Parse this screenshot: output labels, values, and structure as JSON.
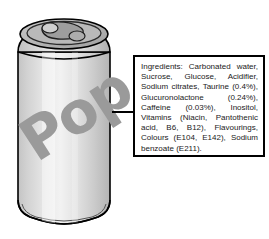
{
  "scene": {
    "background_color": "#ffffff",
    "width": 269,
    "height": 239
  },
  "can": {
    "name": "soda-can",
    "brand_label": "Pop",
    "body_color": "#d6d6d6",
    "highlight_color": "#f1f1f1",
    "logo_color": "#9a9a9a",
    "top_color": "#b8b8b8",
    "outline_color": "#000000",
    "parts": {
      "lid": "can-lid",
      "pull_tab": "pull-tab",
      "shoulder": "can-shoulder",
      "body": "can-body",
      "base": "can-base"
    }
  },
  "leader_line": {
    "name": "callout-leader-line",
    "color": "#000000"
  },
  "callout": {
    "name": "ingredients-callout",
    "border_color": "#000000",
    "background_color": "#ffffff",
    "text_color": "#1a1a1a",
    "heading": "Ingredients:",
    "ingredients_text": "Ingredients: Carbonated water, Sucrose, Glucose, Acidifier, Sodium citrates, Taurine (0.4%), Glucuronolactone (0.24%), Caffeine (0.03%), Inositol, Vitamins (Niacin, Pantothenic acid, B6, B12), Flavourings, Colours (E104, E142), Sodium benzoate (E211).",
    "ingredient_items": [
      "Carbonated water",
      "Sucrose",
      "Glucose",
      "Acidifier",
      "Sodium citrates",
      "Taurine (0.4%)",
      "Glucuronolactone (0.24%)",
      "Caffeine (0.03%)",
      "Inositol",
      "Vitamins (Niacin, Pantothenic acid, B6, B12)",
      "Flavourings",
      "Colours (E104, E142)",
      "Sodium benzoate (E211)"
    ]
  }
}
